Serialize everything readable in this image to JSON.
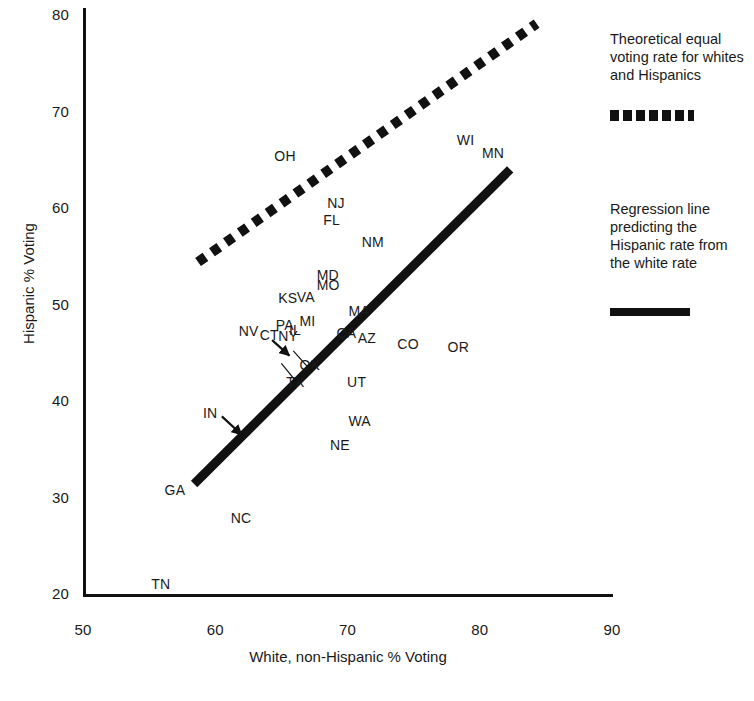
{
  "chart_data": {
    "type": "scatter",
    "title": "",
    "xlabel": "White, non-Hispanic % Voting",
    "ylabel": "Hispanic % Voting",
    "xlim": [
      50,
      90
    ],
    "ylim": [
      20,
      80
    ],
    "xticks": [
      50,
      60,
      70,
      80,
      90
    ],
    "yticks": [
      20,
      30,
      40,
      50,
      60,
      70,
      80
    ],
    "grid": false,
    "legend_position": "right",
    "point_style": "text-label-only",
    "points": [
      {
        "label": "OH",
        "x": 65.3,
        "y": 65.3
      },
      {
        "label": "WI",
        "x": 79.1,
        "y": 66.9
      },
      {
        "label": "MN",
        "x": 81.0,
        "y": 65.6
      },
      {
        "label": "NJ",
        "x": 69.3,
        "y": 60.4
      },
      {
        "label": "FL",
        "x": 69.0,
        "y": 58.7
      },
      {
        "label": "NM",
        "x": 71.9,
        "y": 56.4
      },
      {
        "label": "MD",
        "x": 68.5,
        "y": 53.0
      },
      {
        "label": "MO",
        "x": 68.5,
        "y": 51.9
      },
      {
        "label": "KS",
        "x": 65.6,
        "y": 50.6
      },
      {
        "label": "VA",
        "x": 67.0,
        "y": 50.7
      },
      {
        "label": "MA",
        "x": 70.9,
        "y": 49.2
      },
      {
        "label": "MI",
        "x": 67.2,
        "y": 48.2
      },
      {
        "label": "PA",
        "x": 65.4,
        "y": 47.8
      },
      {
        "label": "IL",
        "x": 66.4,
        "y": 47.3
      },
      {
        "label": "CA",
        "x": 70.0,
        "y": 46.9
      },
      {
        "label": "AZ",
        "x": 71.6,
        "y": 46.4
      },
      {
        "label": "NV",
        "x": 62.6,
        "y": 47.2
      },
      {
        "label": "CT",
        "x": 64.2,
        "y": 46.7
      },
      {
        "label": "NY",
        "x": 65.6,
        "y": 46.6
      },
      {
        "label": "CO",
        "x": 74.6,
        "y": 45.8
      },
      {
        "label": "OR",
        "x": 78.4,
        "y": 45.5
      },
      {
        "label": "OK",
        "x": 67.2,
        "y": 43.6
      },
      {
        "label": "TX",
        "x": 66.2,
        "y": 41.9
      },
      {
        "label": "UT",
        "x": 70.8,
        "y": 41.9
      },
      {
        "label": "IN",
        "x": 59.9,
        "y": 38.7
      },
      {
        "label": "WA",
        "x": 70.9,
        "y": 37.8
      },
      {
        "label": "NE",
        "x": 69.5,
        "y": 35.3
      },
      {
        "label": "GA",
        "x": 57.0,
        "y": 30.7
      },
      {
        "label": "NC",
        "x": 62.0,
        "y": 27.8
      },
      {
        "label": "TN",
        "x": 56.0,
        "y": 20.9
      }
    ],
    "lines": [
      {
        "name": "theoretical-equal-rate-line",
        "style": "dotted",
        "x": [
          58.7,
          84.3
        ],
        "y": [
          54.3,
          79.0
        ]
      },
      {
        "name": "regression-line",
        "style": "solid",
        "x": [
          58.4,
          82.3
        ],
        "y": [
          31.3,
          63.9
        ]
      }
    ],
    "annotations": [
      {
        "name": "in-arrow",
        "label": "IN",
        "from_x": 60.5,
        "from_y": 38.3,
        "to_x": 62.0,
        "to_y": 36.4
      },
      {
        "name": "ct-arrow",
        "label": "CT",
        "from_x": 64.3,
        "from_y": 46.2,
        "to_x": 65.6,
        "to_y": 44.6
      },
      {
        "name": "ok-leader",
        "label": "OK",
        "from_x": 67.0,
        "from_y": 43.4,
        "to_x": 65.9,
        "to_y": 45.1
      },
      {
        "name": "tx-leader",
        "label": "TX",
        "from_x": 66.0,
        "from_y": 42.1,
        "to_x": 65.0,
        "to_y": 43.8
      }
    ]
  },
  "axes": {
    "y_title": "Hispanic % Voting",
    "x_title": "White, non-Hispanic % Voting",
    "y_tick_labels": [
      "80",
      "70",
      "60",
      "50",
      "40",
      "30",
      "20"
    ],
    "x_tick_labels": [
      "50",
      "60",
      "70",
      "80",
      "90"
    ]
  },
  "legend": {
    "theoretical": {
      "text": "Theoretical equal voting rate for whites and Hispanics",
      "swatch": "dotted-line-swatch"
    },
    "regression": {
      "text": "Regression line predicting the Hispanic rate from the white rate",
      "swatch": "solid-line-swatch"
    }
  },
  "colors": {
    "ink": "#111111",
    "text": "#1a1a1a",
    "background": "#ffffff"
  }
}
